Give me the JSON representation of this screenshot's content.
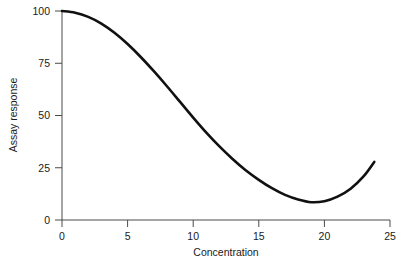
{
  "chart_data": {
    "type": "line",
    "title": "",
    "subtitle": "",
    "xlabel": "Concentration",
    "ylabel": "Assay response",
    "xlim": [
      0,
      25
    ],
    "ylim": [
      0,
      100
    ],
    "grid": false,
    "legend": "none",
    "annotations": [],
    "xticks": [
      0,
      5,
      10,
      15,
      20,
      25
    ],
    "xtick_labels": [
      "0",
      "5",
      "10",
      "15",
      "20",
      "25"
    ],
    "yticks": [
      0,
      25,
      50,
      75,
      100
    ],
    "ytick_labels": [
      "0",
      "25",
      "50",
      "75",
      "100"
    ],
    "series": [
      {
        "name": "Assay response",
        "color": "#111111",
        "x": [
          0,
          1,
          2,
          3,
          4,
          5,
          6,
          7,
          8,
          9,
          10,
          11,
          12,
          13,
          14,
          15,
          16,
          17,
          18,
          19,
          20,
          21,
          22,
          23,
          23.8
        ],
        "values": [
          100,
          99.2,
          97.2,
          94.0,
          89.6,
          84.2,
          78.0,
          71.2,
          64.0,
          56.5,
          49.0,
          41.8,
          35.2,
          29.2,
          23.8,
          19.2,
          15.2,
          12.0,
          9.8,
          8.5,
          9.0,
          11.2,
          15.0,
          21.0,
          27.8
        ]
      }
    ]
  },
  "axes": {
    "x_axis_name": "concentration-axis",
    "y_axis_name": "assay-response-axis"
  }
}
